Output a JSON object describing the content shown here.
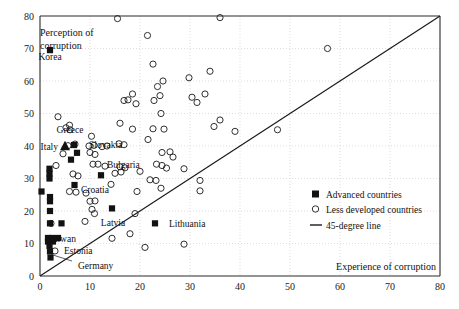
{
  "chart_data": {
    "type": "scatter",
    "title": "",
    "xlabel": "Experience of corruption",
    "ylabel": "Perception of corruption",
    "xlim": [
      0,
      80
    ],
    "ylim": [
      0,
      80
    ],
    "xticks": [
      0,
      10,
      20,
      30,
      40,
      50,
      60,
      70,
      80
    ],
    "yticks": [
      0,
      10,
      20,
      30,
      40,
      50,
      60,
      70,
      80
    ],
    "grid": true,
    "legend_position": "right-lower",
    "legend": [
      {
        "key": "advanced",
        "marker": "filled-square",
        "label": "Advanced countries"
      },
      {
        "key": "less_developed",
        "marker": "open-circle",
        "label": "Less developed countries"
      },
      {
        "key": "reference",
        "marker": "line",
        "label": "45-degree line"
      }
    ],
    "reference_line": {
      "type": "identity",
      "from": [
        0,
        0
      ],
      "to": [
        80,
        80
      ],
      "label": "45-degree line"
    },
    "series": [
      {
        "name": "Advanced countries",
        "marker": "filled-square",
        "points": [
          [
            2.0,
            69.5
          ],
          [
            1.9,
            33.0
          ],
          [
            1.9,
            31.5
          ],
          [
            1.9,
            30.0
          ],
          [
            0.3,
            26.0
          ],
          [
            2.0,
            24.3
          ],
          [
            2.0,
            23.0
          ],
          [
            6.8,
            40.3
          ],
          [
            7.4,
            37.9
          ],
          [
            6.2,
            35.8
          ],
          [
            12.2,
            31.0
          ],
          [
            6.9,
            28.0
          ],
          [
            2.0,
            20.0
          ],
          [
            2.0,
            16.2
          ],
          [
            4.3,
            16.2
          ],
          [
            14.4,
            20.8
          ],
          [
            23.0,
            16.2
          ],
          [
            1.6,
            11.7
          ],
          [
            2.4,
            11.7
          ],
          [
            3.6,
            11.7
          ],
          [
            1.6,
            10.6
          ],
          [
            2.6,
            10.6
          ],
          [
            1.9,
            9.3
          ],
          [
            2.0,
            7.6
          ],
          [
            2.1,
            5.7
          ]
        ]
      },
      {
        "name": "Advanced countries (Italy marker)",
        "marker": "filled-triangle",
        "points": [
          [
            5.0,
            40.0
          ]
        ]
      },
      {
        "name": "Less developed countries",
        "marker": "open-circle",
        "points": [
          [
            15.5,
            79.2
          ],
          [
            36.0,
            79.5
          ],
          [
            57.5,
            70.0
          ],
          [
            21.5,
            74.0
          ],
          [
            22.6,
            65.2
          ],
          [
            29.8,
            61.0
          ],
          [
            34.0,
            63.0
          ],
          [
            23.5,
            58.3
          ],
          [
            24.6,
            60.0
          ],
          [
            18.5,
            56.0
          ],
          [
            17.6,
            54.2
          ],
          [
            16.8,
            54.0
          ],
          [
            19.2,
            53.0
          ],
          [
            22.8,
            54.0
          ],
          [
            24.0,
            55.5
          ],
          [
            30.4,
            55.0
          ],
          [
            31.4,
            53.4
          ],
          [
            33.0,
            56.0
          ],
          [
            24.2,
            50.0
          ],
          [
            3.6,
            49.0
          ],
          [
            16.0,
            47.0
          ],
          [
            18.5,
            45.2
          ],
          [
            22.6,
            45.3
          ],
          [
            24.8,
            45.2
          ],
          [
            34.8,
            46.0
          ],
          [
            36.0,
            48.0
          ],
          [
            39.0,
            44.5
          ],
          [
            5.9,
            46.4
          ],
          [
            5.2,
            45.6
          ],
          [
            10.3,
            43.0
          ],
          [
            21.6,
            42.0
          ],
          [
            47.5,
            45.0
          ],
          [
            5.6,
            40.1
          ],
          [
            7.0,
            40.6
          ],
          [
            9.8,
            40.0
          ],
          [
            10.8,
            40.2
          ],
          [
            12.4,
            39.8
          ],
          [
            13.4,
            40.0
          ],
          [
            15.8,
            40.7
          ],
          [
            16.8,
            40.4
          ],
          [
            4.6,
            37.6
          ],
          [
            10.0,
            38.0
          ],
          [
            11.0,
            37.4
          ],
          [
            24.4,
            38.0
          ],
          [
            26.0,
            38.2
          ],
          [
            26.6,
            36.6
          ],
          [
            23.3,
            34.4
          ],
          [
            24.4,
            34.0
          ],
          [
            25.3,
            33.2
          ],
          [
            10.6,
            34.4
          ],
          [
            11.6,
            34.4
          ],
          [
            13.0,
            33.8
          ],
          [
            3.2,
            34.0
          ],
          [
            16.0,
            33.6
          ],
          [
            17.0,
            33.3
          ],
          [
            20.0,
            32.2
          ],
          [
            28.8,
            33.0
          ],
          [
            6.6,
            31.4
          ],
          [
            7.6,
            30.8
          ],
          [
            15.0,
            31.6
          ],
          [
            16.2,
            32.0
          ],
          [
            22.0,
            29.6
          ],
          [
            23.2,
            29.4
          ],
          [
            32.0,
            29.4
          ],
          [
            5.9,
            26.0
          ],
          [
            7.2,
            25.8
          ],
          [
            9.2,
            25.5
          ],
          [
            14.2,
            28.2
          ],
          [
            19.4,
            26.0
          ],
          [
            24.2,
            27.0
          ],
          [
            32.0,
            26.2
          ],
          [
            10.0,
            23.0
          ],
          [
            11.0,
            23.1
          ],
          [
            10.4,
            20.5
          ],
          [
            10.9,
            19.2
          ],
          [
            9.0,
            16.8
          ],
          [
            19.0,
            19.2
          ],
          [
            2.2,
            16.2
          ],
          [
            3.0,
            7.7
          ],
          [
            14.4,
            11.6
          ],
          [
            21.0,
            8.8
          ],
          [
            28.8,
            9.8
          ],
          [
            6.0,
            45.0
          ],
          [
            18.0,
            13.0
          ]
        ]
      }
    ],
    "annotations": [
      {
        "label": "Korea",
        "x": 2.0,
        "y": 69.5,
        "anchor": "below"
      },
      {
        "label": "Italy",
        "x": 5.0,
        "y": 40.0,
        "anchor": "left"
      },
      {
        "label": "Greece",
        "x": 6.0,
        "y": 43.0,
        "anchor": "above"
      },
      {
        "label": "Slovakia",
        "x": 9.0,
        "y": 40.6,
        "anchor": "right"
      },
      {
        "label": "Bulgaria",
        "x": 12.6,
        "y": 34.4,
        "anchor": "right"
      },
      {
        "label": "Croatia",
        "x": 7.4,
        "y": 26.6,
        "anchor": "right"
      },
      {
        "label": "Latvia",
        "x": 14.6,
        "y": 18.4,
        "anchor": "below"
      },
      {
        "label": "Lithuania",
        "x": 25.0,
        "y": 16.2,
        "anchor": "right"
      },
      {
        "label": "Taiwan",
        "x": 4.4,
        "y": 13.4,
        "anchor": "below"
      },
      {
        "label": "Estonia",
        "x": 4.0,
        "y": 8.0,
        "anchor": "right"
      },
      {
        "label": "Germany",
        "x": 6.8,
        "y": 3.2,
        "anchor": "right"
      }
    ]
  },
  "axes": {
    "x_title": "Experience of corruption",
    "y_title_line1": "Perception of",
    "y_title_line2": "corruption",
    "x_tick_labels": [
      "0",
      "10",
      "20",
      "30",
      "40",
      "50",
      "60",
      "70",
      "80"
    ],
    "y_tick_labels": [
      "0",
      "10",
      "20",
      "30",
      "40",
      "50",
      "60",
      "70",
      "80"
    ]
  },
  "legend": {
    "advanced_label": "Advanced countries",
    "less_developed_label": "Less developed countries",
    "reference_label": "45-degree line"
  },
  "colors": {
    "marker": "#121212",
    "axis": "#2b2b2b",
    "grid": "#c9c4cf",
    "background": "#ffffff"
  }
}
